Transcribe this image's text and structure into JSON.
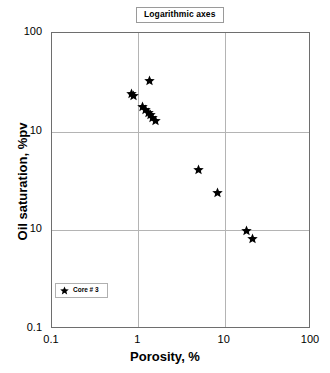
{
  "chart_data": {
    "type": "scatter",
    "title": "Logarithmic axes",
    "xlabel": "Porosity, %",
    "ylabel": "Oil saturation, %pv",
    "xscale": "log",
    "yscale": "log",
    "xlim": [
      0.1,
      100
    ],
    "ylim": [
      0.1,
      100
    ],
    "grid": true,
    "xticks": [
      "0.1",
      "1",
      "10",
      "100"
    ],
    "xtick_values": [
      0.1,
      1,
      10,
      100
    ],
    "yticks": [
      "100",
      "10",
      "10",
      "0.1"
    ],
    "ytick_values": [
      100,
      10,
      1,
      0.1
    ],
    "legend": {
      "position": "lower-left",
      "entries": [
        {
          "label": "Core # 3",
          "marker": "star",
          "color": "#000000"
        }
      ]
    },
    "series": [
      {
        "name": "Core # 3",
        "marker": "star",
        "color": "#000000",
        "points": [
          {
            "x": 0.84,
            "y": 24.5
          },
          {
            "x": 0.89,
            "y": 23.0
          },
          {
            "x": 1.35,
            "y": 33.0
          },
          {
            "x": 1.13,
            "y": 18.2
          },
          {
            "x": 1.22,
            "y": 16.8
          },
          {
            "x": 1.31,
            "y": 15.6
          },
          {
            "x": 1.39,
            "y": 14.8
          },
          {
            "x": 1.47,
            "y": 14.0
          },
          {
            "x": 1.56,
            "y": 13.1
          },
          {
            "x": 5.0,
            "y": 4.1
          },
          {
            "x": 8.3,
            "y": 2.4
          },
          {
            "x": 18.0,
            "y": 1.0
          },
          {
            "x": 21.0,
            "y": 0.82
          }
        ]
      }
    ]
  },
  "figure": {
    "background": "#ffffff",
    "frame_color": "#6e6e6e",
    "grid_color": "#b4b4b4"
  }
}
